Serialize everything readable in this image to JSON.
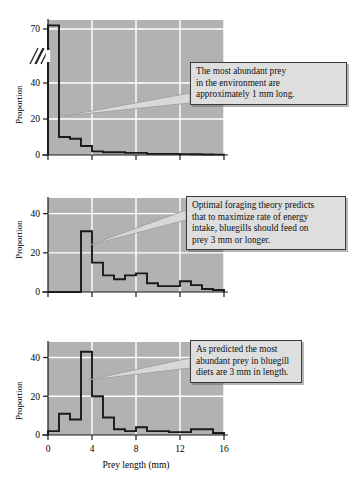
{
  "figure": {
    "background_color": "#ffffff",
    "plot_background_color": "#b2b2b2",
    "grid_color": "#ffffff",
    "line_color": "#1a1a1a",
    "callout_fill": "#dedede",
    "callout_border": "#3a3a3a"
  },
  "axis": {
    "xlabel": "Prey length (mm)",
    "ylabel": "Proportion",
    "xticks": [
      "0",
      "4",
      "8",
      "12",
      "16"
    ],
    "xtick_values": [
      0,
      4,
      8,
      12,
      16
    ],
    "xlim": [
      0,
      16
    ]
  },
  "callouts": [
    {
      "id": "callout-environment",
      "lines": [
        "The most abundant prey",
        "in the environment are",
        "approximately 1 mm long."
      ]
    },
    {
      "id": "callout-optimal-foraging",
      "lines": [
        "Optimal foraging theory predicts",
        "that to maximize rate of energy",
        "intake, bluegills should feed on",
        "prey 3 mm or longer."
      ]
    },
    {
      "id": "callout-diet",
      "lines": [
        "As predicted the most",
        "abundant prey in bluegill",
        "diets are 3 mm in length."
      ]
    }
  ],
  "chart_data": [
    {
      "type": "bar",
      "id": "panel-1-environment",
      "title": "",
      "xlabel": "",
      "ylabel": "Proportion",
      "xlim": [
        0,
        16
      ],
      "ylim": [
        0,
        75
      ],
      "yticks": [
        0,
        20,
        40,
        70
      ],
      "ytick_labels": [
        "0",
        "20",
        "40",
        "70"
      ],
      "axis_break": true,
      "axis_break_between": [
        40,
        70
      ],
      "grid": true,
      "bin_width": 1,
      "bin_starts": [
        0,
        1,
        2,
        3,
        4,
        5,
        6,
        7,
        8,
        9,
        10,
        11,
        12,
        13,
        14,
        15
      ],
      "values": [
        72,
        10,
        9,
        5,
        2,
        1.5,
        1.5,
        1.2,
        1.2,
        0.6,
        0.6,
        0.6,
        0.5,
        0.4,
        0.3,
        0.2
      ]
    },
    {
      "type": "bar",
      "id": "panel-2-optimal",
      "title": "",
      "xlabel": "",
      "ylabel": "Proportion",
      "xlim": [
        0,
        16
      ],
      "ylim": [
        0,
        48
      ],
      "yticks": [
        0,
        20,
        40
      ],
      "ytick_labels": [
        "0",
        "20",
        "40"
      ],
      "axis_break": false,
      "grid": true,
      "bin_width": 1,
      "bin_starts": [
        0,
        1,
        2,
        3,
        4,
        5,
        6,
        7,
        8,
        9,
        10,
        11,
        12,
        13,
        14,
        15
      ],
      "values": [
        0,
        0,
        0,
        31,
        15,
        8.5,
        6.5,
        8.5,
        9.5,
        4.5,
        3,
        3,
        5.5,
        3.5,
        1.5,
        1
      ]
    },
    {
      "type": "bar",
      "id": "panel-3-diet",
      "title": "",
      "xlabel": "Prey length (mm)",
      "ylabel": "Proportion",
      "xlim": [
        0,
        16
      ],
      "ylim": [
        0,
        48
      ],
      "yticks": [
        0,
        20,
        40
      ],
      "ytick_labels": [
        "0",
        "20",
        "40"
      ],
      "axis_break": false,
      "grid": true,
      "bin_width": 1,
      "bin_starts": [
        0,
        1,
        2,
        3,
        4,
        5,
        6,
        7,
        8,
        9,
        10,
        11,
        12,
        13,
        14,
        15
      ],
      "values": [
        2,
        11,
        8,
        43,
        20,
        9,
        3,
        2,
        4,
        2,
        2,
        1.5,
        1.5,
        3,
        3,
        1
      ]
    }
  ]
}
